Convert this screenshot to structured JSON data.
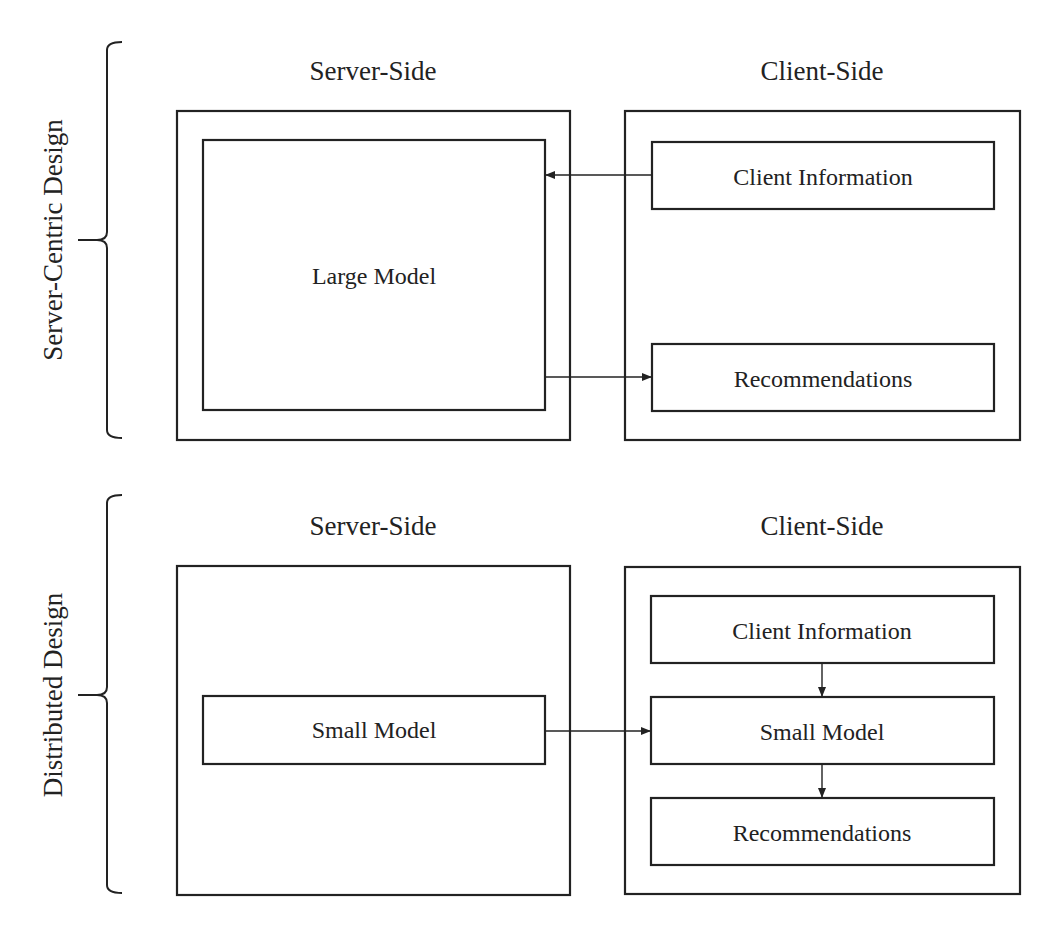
{
  "colors": {
    "stroke": "#222222",
    "background": "#ffffff"
  },
  "sections": [
    {
      "title": "Server-Centric Design",
      "server": {
        "heading": "Server-Side",
        "boxes": [
          {
            "label": "Large Model"
          }
        ]
      },
      "client": {
        "heading": "Client-Side",
        "boxes": [
          {
            "label": "Client Information"
          },
          {
            "label": "Recommendations"
          }
        ]
      },
      "arrows": [
        {
          "from": "Client Information",
          "to": "Large Model"
        },
        {
          "from": "Large Model",
          "to": "Recommendations"
        }
      ]
    },
    {
      "title": "Distributed Design",
      "server": {
        "heading": "Server-Side",
        "boxes": [
          {
            "label": "Small Model"
          }
        ]
      },
      "client": {
        "heading": "Client-Side",
        "boxes": [
          {
            "label": "Client Information"
          },
          {
            "label": "Small Model"
          },
          {
            "label": "Recommendations"
          }
        ]
      },
      "arrows": [
        {
          "from": "Small Model (server)",
          "to": "Small Model (client)"
        },
        {
          "from": "Client Information",
          "to": "Small Model (client)"
        },
        {
          "from": "Small Model (client)",
          "to": "Recommendations"
        }
      ]
    }
  ]
}
